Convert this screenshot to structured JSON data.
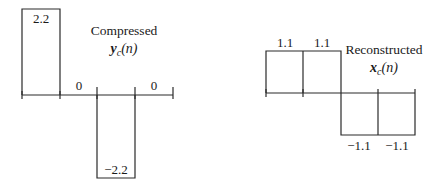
{
  "diagrams": [
    {
      "name": "compressed",
      "title": "Compressed",
      "signal_var": "y",
      "signal_sub": "c",
      "signal_arg": "(n)",
      "values": [
        "2.2",
        "0",
        "−2.2",
        "0"
      ],
      "numeric_values": [
        2.2,
        0,
        -2.2,
        0
      ]
    },
    {
      "name": "reconstructed",
      "title": "Reconstructed",
      "signal_var": "x",
      "signal_sub": "c",
      "signal_arg": "(n)",
      "values": [
        "1.1",
        "1.1",
        "−1.1",
        "−1.1"
      ],
      "numeric_values": [
        1.1,
        1.1,
        -1.1,
        -1.1
      ]
    }
  ],
  "colors": {
    "line": "#2a2a2a",
    "text": "#1a1a1a",
    "background": "#ffffff"
  }
}
